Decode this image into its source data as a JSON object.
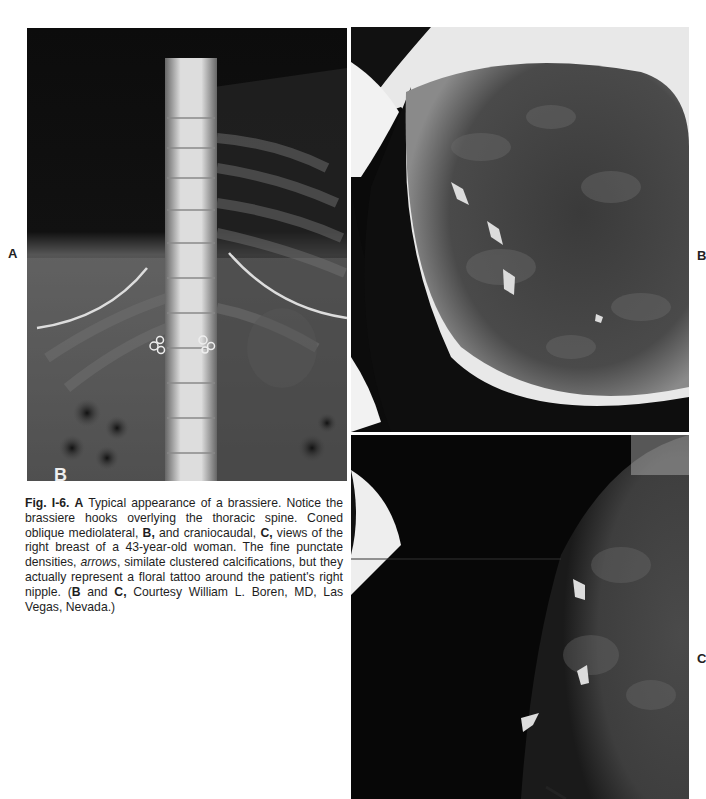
{
  "figure": {
    "number": "Fig. I-6.",
    "panels": [
      {
        "id": "A",
        "label": "A",
        "description": "Frontal radiograph of thoracic/upper lumbar spine with brassiere hooks overlying the spine and underwire arcs",
        "corner_mark": "B"
      },
      {
        "id": "B",
        "label": "B",
        "description": "Coned oblique mediolateral mammogram of right breast with three white arrows"
      },
      {
        "id": "C",
        "label": "C",
        "description": "Craniocaudal mammogram of right breast with three white arrows"
      }
    ],
    "caption": {
      "fig_label": "Fig. I-6.",
      "a_ref": "A",
      "text1": " Typical appearance of a brassiere. Notice the brassiere hooks overlying the thoracic spine.  Coned oblique mediolateral, ",
      "b_ref": "B,",
      "text2": " and craniocaudal, ",
      "c_ref": "C,",
      "text3": " views of the right breast of a 43-year-old woman. The fine punctate densities, ",
      "arrows_word": "arrows",
      "text4": ", similate clustered calcifications, but they actually represent a floral tattoo around the patient's right nipple. (",
      "b_ref2": "B",
      "text5": " and ",
      "c_ref2": "C,",
      "text6": " Courtesy William L. Boren, MD, Las Vegas, Nevada.)"
    }
  }
}
